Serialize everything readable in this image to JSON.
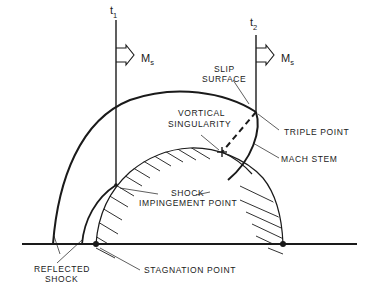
{
  "diagram": {
    "type": "shock reflection schematic",
    "time_markers": [
      {
        "label": "t",
        "subscript": "1"
      },
      {
        "label": "t",
        "subscript": "2"
      }
    ],
    "shock_velocity_label": {
      "main": "M",
      "subscript": "s"
    },
    "labels": {
      "slip_surface_1": "SLIP",
      "slip_surface_2": "SURFACE",
      "vortical_1": "VORTICAL",
      "vortical_2": "SINGULARITY",
      "triple_point": "TRIPLE POINT",
      "mach_stem": "MACH STEM",
      "shock_impingement_1": "SHOCK",
      "shock_impingement_2": "IMPINGEMENT POINT",
      "reflected_shock_1": "REFLECTED",
      "reflected_shock_2": "SHOCK",
      "stagnation_point": "STAGNATION POINT"
    },
    "colors": {
      "line": "#1a1a1a",
      "background": "#ffffff"
    }
  }
}
